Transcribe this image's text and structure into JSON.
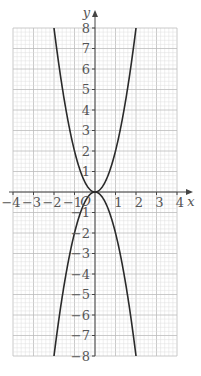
{
  "chart_data": {
    "type": "line",
    "title": "",
    "xlabel": "x",
    "ylabel": "y",
    "origin_label": "O",
    "xlim": [
      -4,
      4
    ],
    "ylim": [
      -8,
      8
    ],
    "grid": true,
    "grid_minor_per_unit": 5,
    "x_ticks": [
      -4,
      -3,
      -2,
      -1,
      1,
      2,
      3,
      4
    ],
    "x_tick_labels": [
      "−4",
      "−3",
      "−2",
      "−1",
      "1",
      "2",
      "3",
      "4"
    ],
    "y_ticks": [
      8,
      7,
      6,
      5,
      4,
      3,
      2,
      1,
      -1,
      -2,
      -3,
      -4,
      -5,
      -6,
      -7,
      -8
    ],
    "y_tick_labels": [
      "8",
      "7",
      "6",
      "5",
      "4",
      "3",
      "2",
      "1",
      "−1",
      "−2",
      "−3",
      "−4",
      "−5",
      "−6",
      "−7",
      "−8"
    ],
    "series": [
      {
        "name": "y = 2x²",
        "expression": "2x^2",
        "x": [
          -2,
          -1.5,
          -1,
          -0.5,
          0,
          0.5,
          1,
          1.5,
          2
        ],
        "values": [
          8,
          4.5,
          2,
          0.5,
          0,
          0.5,
          2,
          4.5,
          8
        ]
      },
      {
        "name": "y = −2x²",
        "expression": "-2x^2",
        "x": [
          -2,
          -1.5,
          -1,
          -0.5,
          0,
          0.5,
          1,
          1.5,
          2
        ],
        "values": [
          -8,
          -4.5,
          -2,
          -0.5,
          0,
          -0.5,
          -2,
          -4.5,
          -8
        ]
      }
    ],
    "colors": {
      "curve": "#2a2a2a",
      "axis": "#444444",
      "grid_major": "#bdbdbd",
      "grid_minor": "#dedede"
    }
  }
}
